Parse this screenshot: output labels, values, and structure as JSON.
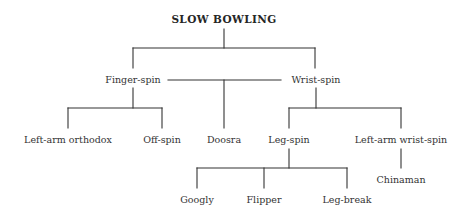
{
  "diagram": {
    "type": "tree",
    "line_color": "#333333",
    "root": {
      "id": "slow-bowling",
      "label": "SLOW BOWLING",
      "x": 224,
      "y": 19
    },
    "nodes": [
      {
        "id": "finger-spin",
        "label": "Finger-spin",
        "x": 133,
        "y": 80
      },
      {
        "id": "wrist-spin",
        "label": "Wrist-spin",
        "x": 316,
        "y": 80
      },
      {
        "id": "left-arm-orthodox",
        "label": "Left-arm orthodox",
        "x": 68,
        "y": 140
      },
      {
        "id": "off-spin",
        "label": "Off-spin",
        "x": 162,
        "y": 140
      },
      {
        "id": "doosra",
        "label": "Doosra",
        "x": 224,
        "y": 140
      },
      {
        "id": "leg-spin",
        "label": "Leg-spin",
        "x": 289,
        "y": 140
      },
      {
        "id": "left-arm-wrist-spin",
        "label": "Left-arm wrist-spin",
        "x": 401,
        "y": 140
      },
      {
        "id": "googly",
        "label": "Googly",
        "x": 197,
        "y": 200
      },
      {
        "id": "flipper",
        "label": "Flipper",
        "x": 264,
        "y": 200
      },
      {
        "id": "leg-break",
        "label": "Leg-break",
        "x": 347,
        "y": 200
      },
      {
        "id": "chinaman",
        "label": "Chinaman",
        "x": 401,
        "y": 180
      }
    ],
    "edges": [
      {
        "from": "SLOW BOWLING",
        "to": "Finger-spin"
      },
      {
        "from": "SLOW BOWLING",
        "to": "Wrist-spin"
      },
      {
        "from": "Finger-spin",
        "to": "Left-arm orthodox"
      },
      {
        "from": "Finger-spin",
        "to": "Off-spin"
      },
      {
        "from": "Finger-spin + Wrist-spin",
        "to": "Doosra"
      },
      {
        "from": "Wrist-spin",
        "to": "Leg-spin"
      },
      {
        "from": "Wrist-spin",
        "to": "Left-arm wrist-spin"
      },
      {
        "from": "Leg-spin",
        "to": "Googly"
      },
      {
        "from": "Leg-spin",
        "to": "Flipper"
      },
      {
        "from": "Leg-spin",
        "to": "Leg-break"
      },
      {
        "from": "Left-arm wrist-spin",
        "to": "Chinaman"
      }
    ]
  }
}
